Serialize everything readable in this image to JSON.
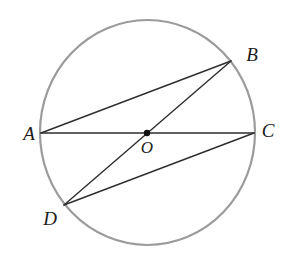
{
  "figure": {
    "type": "geometry-circle-diagram",
    "background": "#ffffff",
    "circle": {
      "cx": 147.5,
      "cy": 132.5,
      "rx": 107.5,
      "ry": 112.5,
      "stroke": "#9b9b9b",
      "stroke_width": 2.2
    },
    "center": {
      "label": "O",
      "x": 147,
      "y": 133,
      "dot_radius": 3.2,
      "label_x": 147,
      "label_y": 153,
      "font_size": 17
    },
    "points": [
      {
        "label": "A",
        "x": 41,
        "y": 133,
        "label_x": 29,
        "label_y": 140,
        "font_size": 19
      },
      {
        "label": "B",
        "x": 231,
        "y": 61,
        "label_x": 252,
        "label_y": 61,
        "font_size": 19
      },
      {
        "label": "C",
        "x": 254,
        "y": 133,
        "label_x": 268,
        "label_y": 137,
        "font_size": 19
      },
      {
        "label": "D",
        "x": 64,
        "y": 205,
        "label_x": 50,
        "label_y": 225,
        "font_size": 19
      }
    ],
    "segments": [
      {
        "id": "AC",
        "from": "A",
        "to": "C",
        "through_center": true
      },
      {
        "id": "BD",
        "from": "B",
        "to": "D",
        "through_center": true
      },
      {
        "id": "AB",
        "from": "A",
        "to": "B",
        "through_center": false
      },
      {
        "id": "DC",
        "from": "D",
        "to": "C",
        "through_center": false
      }
    ],
    "line_color": "#2e2e2e",
    "line_width": 1.4,
    "label_color": "#1c1c1c",
    "dot_color": "#111111"
  }
}
